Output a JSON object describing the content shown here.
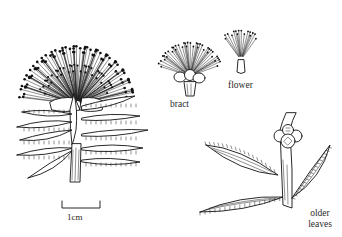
{
  "figure": {
    "type": "botanical line illustration",
    "subjects": [
      {
        "id": "flowering-shoot",
        "description": "flowering shoot with spherical flower head and narrow hairy leaves"
      },
      {
        "id": "bract",
        "description": "detached bract with cluster of flowers"
      },
      {
        "id": "flower",
        "description": "single flower with stamens"
      },
      {
        "id": "older-leaves",
        "description": "stem with older leaves and fruit capsules"
      }
    ]
  },
  "labels": {
    "bract": "bract",
    "flower": "flower",
    "older_leaves": "older leaves",
    "scale": "1cm"
  },
  "scale_bar": {
    "length_label": "1cm"
  },
  "colors": {
    "ink": "#111111",
    "background": "#ffffff"
  }
}
